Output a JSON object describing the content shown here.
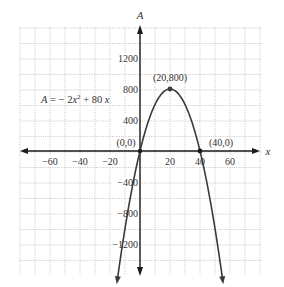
{
  "chart_data": {
    "type": "line",
    "title": "",
    "equation": "A = − 2x² + 80 x",
    "xlabel": "x",
    "ylabel": "A",
    "xlim": [
      -80,
      80
    ],
    "ylim": [
      -1600,
      1600
    ],
    "grid": true,
    "x_ticks": [
      -60,
      -40,
      -20,
      20,
      40,
      60
    ],
    "y_ticks": [
      1200,
      800,
      400,
      -400,
      -800,
      -1200
    ],
    "series": [
      {
        "name": "A = -2x^2 + 80x",
        "function": "-2*x*x + 80*x",
        "x_range": [
          -15.5,
          55.5
        ],
        "x": [
          -15.5,
          -10,
          0,
          10,
          20,
          30,
          40,
          50,
          55.5
        ],
        "values": [
          -1720.5,
          -1000,
          0,
          600,
          800,
          600,
          0,
          -1000,
          -1720.5
        ]
      }
    ],
    "annotations": [
      {
        "label": "(0,0)",
        "x": 0,
        "y": 0
      },
      {
        "label": "(20,800)",
        "x": 20,
        "y": 800
      },
      {
        "label": "(40,0)",
        "x": 40,
        "y": 0
      }
    ]
  },
  "labels": {
    "x_axis": "x",
    "y_axis": "A",
    "equation": "A = − 2x² + 80 x",
    "ticks_x": [
      "−60",
      "−40",
      "−20",
      "20",
      "40",
      "60"
    ],
    "ticks_y": [
      "1200",
      "800",
      "400",
      "−400",
      "−800",
      "−1200"
    ],
    "point_origin": "(0,0)",
    "point_vertex": "(20,800)",
    "point_root": "(40,0)"
  },
  "colors": {
    "axis": "#1a1a1a",
    "curve": "#3a3a3a",
    "grid": "#b8b8b8",
    "background": "#ffffff"
  }
}
